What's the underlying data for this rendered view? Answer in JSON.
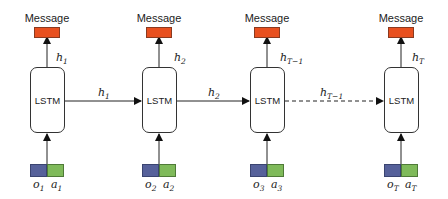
{
  "diagram": {
    "title": "",
    "message_label": "Message",
    "cell_label": "LSTM",
    "colors": {
      "message": "#e8501f",
      "observation": "#56619a",
      "action": "#7fba5a",
      "line": "#222222"
    },
    "cells": [
      {
        "id": "t1",
        "lstm": "LSTM",
        "message": "Message",
        "output_h": "h",
        "output_sub": "1",
        "obs": "o",
        "obs_sub": "1",
        "act": "a",
        "act_sub": "1"
      },
      {
        "id": "t2",
        "lstm": "LSTM",
        "message": "Message",
        "output_h": "h",
        "output_sub": "2",
        "obs": "o",
        "obs_sub": "2",
        "act": "a",
        "act_sub": "2"
      },
      {
        "id": "t3",
        "lstm": "LSTM",
        "message": "Message",
        "output_h": "h",
        "output_sub": "T−1",
        "obs": "o",
        "obs_sub": "3",
        "act": "a",
        "act_sub": "3"
      },
      {
        "id": "tT",
        "lstm": "LSTM",
        "message": "Message",
        "output_h": "h",
        "output_sub": "T",
        "obs": "o",
        "obs_sub": "T",
        "act": "a",
        "act_sub": "T"
      }
    ],
    "edges": [
      {
        "from": "t1",
        "to": "t2",
        "label": "h",
        "label_sub": "1",
        "style": "solid"
      },
      {
        "from": "t2",
        "to": "t3",
        "label": "h",
        "label_sub": "2",
        "style": "solid"
      },
      {
        "from": "t3",
        "to": "tT",
        "label": "h",
        "label_sub": "T−1",
        "style": "dashed"
      }
    ]
  }
}
